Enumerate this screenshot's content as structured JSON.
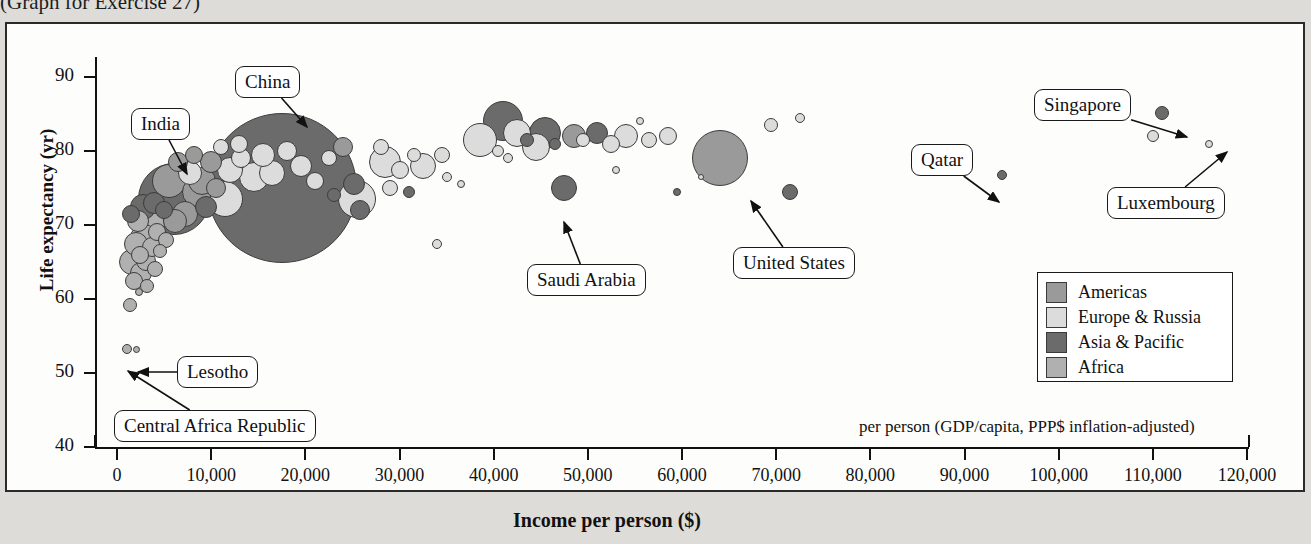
{
  "caption": "(Graph for Exercise 27)",
  "chart_data": {
    "type": "scatter",
    "title": "",
    "xlabel": "Income per person ($)",
    "ylabel": "Life expectancy (yr)",
    "note": "per person (GDP/capita, PPP$ inflation-adjusted)",
    "xlim": [
      0,
      120000
    ],
    "ylim": [
      40,
      90
    ],
    "xticks": [
      0,
      10000,
      20000,
      30000,
      40000,
      50000,
      60000,
      70000,
      80000,
      90000,
      100000,
      110000,
      120000
    ],
    "xticklabels": [
      "0",
      "10,000",
      "20,000",
      "30,000",
      "40,000",
      "50,000",
      "60,000",
      "70,000",
      "80,000",
      "90,000",
      "100,000",
      "110,000",
      "120,000"
    ],
    "yticks": [
      40,
      50,
      60,
      70,
      80,
      90
    ],
    "yticklabels": [
      "40",
      "50",
      "60",
      "70",
      "80",
      "90"
    ],
    "grid": false,
    "legend_position": "right-inside",
    "bubble_meaning": "bubble area proportional to population",
    "legend": [
      {
        "label": "Americas",
        "color": "#9a9a9a"
      },
      {
        "label": "Europe & Russia",
        "color": "#dcdcdc"
      },
      {
        "label": "Asia & Pacific",
        "color": "#6b6b6b"
      },
      {
        "label": "Africa",
        "color": "#b0b0b0"
      }
    ],
    "annotations": [
      {
        "label": "China",
        "box_x": 228,
        "box_y": 42,
        "tip_x": 300,
        "tip_y": 103
      },
      {
        "label": "India",
        "box_x": 124,
        "box_y": 84,
        "tip_x": 180,
        "tip_y": 150
      },
      {
        "label": "Lesotho",
        "box_x": 170,
        "box_y": 332,
        "tip_x": 131,
        "tip_y": 348
      },
      {
        "label": "Central Africa Republic",
        "box_x": 107,
        "box_y": 386,
        "tip_x": 121,
        "tip_y": 347
      },
      {
        "label": "Saudi Arabia",
        "box_x": 520,
        "box_y": 240,
        "tip_x": 557,
        "tip_y": 198
      },
      {
        "label": "United States",
        "box_x": 726,
        "box_y": 223,
        "tip_x": 744,
        "tip_y": 177
      },
      {
        "label": "Qatar",
        "box_x": 904,
        "box_y": 120,
        "tip_x": 992,
        "tip_y": 178
      },
      {
        "label": "Singapore",
        "box_x": 1027,
        "box_y": 65,
        "tip_x": 1180,
        "tip_y": 113
      },
      {
        "label": "Luxembourg",
        "box_x": 1100,
        "box_y": 163,
        "tip_x": 1220,
        "tip_y": 128
      }
    ],
    "points": [
      {
        "x": 1100,
        "y": 53.3,
        "r": 5,
        "g": "Africa"
      },
      {
        "x": 2100,
        "y": 53.2,
        "r": 3.5,
        "g": "Africa"
      },
      {
        "x": 1400,
        "y": 59.2,
        "r": 7,
        "g": "Africa"
      },
      {
        "x": 2300,
        "y": 61.0,
        "r": 4,
        "g": "Africa"
      },
      {
        "x": 1800,
        "y": 62.5,
        "r": 9,
        "g": "Africa"
      },
      {
        "x": 2600,
        "y": 63.5,
        "r": 11,
        "g": "Africa"
      },
      {
        "x": 3200,
        "y": 61.8,
        "r": 7,
        "g": "Africa"
      },
      {
        "x": 1600,
        "y": 65.0,
        "r": 13,
        "g": "Africa"
      },
      {
        "x": 2400,
        "y": 66.0,
        "r": 9,
        "g": "Africa"
      },
      {
        "x": 3100,
        "y": 65.2,
        "r": 10,
        "g": "Africa"
      },
      {
        "x": 4000,
        "y": 64.0,
        "r": 8,
        "g": "Africa"
      },
      {
        "x": 2000,
        "y": 67.5,
        "r": 12,
        "g": "Africa"
      },
      {
        "x": 2900,
        "y": 68.2,
        "r": 14,
        "g": "Africa"
      },
      {
        "x": 3700,
        "y": 67.0,
        "r": 10,
        "g": "Africa"
      },
      {
        "x": 4600,
        "y": 66.5,
        "r": 7,
        "g": "Africa"
      },
      {
        "x": 2200,
        "y": 70.5,
        "r": 11,
        "g": "Africa"
      },
      {
        "x": 3400,
        "y": 70.0,
        "r": 16,
        "g": "Africa"
      },
      {
        "x": 4300,
        "y": 69.0,
        "r": 9,
        "g": "Africa"
      },
      {
        "x": 5200,
        "y": 68.0,
        "r": 8,
        "g": "Africa"
      },
      {
        "x": 1500,
        "y": 71.5,
        "r": 9,
        "g": "Asia & Pacific"
      },
      {
        "x": 2800,
        "y": 72.5,
        "r": 13,
        "g": "Asia & Pacific"
      },
      {
        "x": 3900,
        "y": 73.0,
        "r": 11,
        "g": "Asia & Pacific"
      },
      {
        "x": 5000,
        "y": 72.0,
        "r": 9,
        "g": "Asia & Pacific"
      },
      {
        "x": 6200,
        "y": 70.5,
        "r": 12,
        "g": "Americas"
      },
      {
        "x": 6000,
        "y": 73.5,
        "r": 36,
        "g": "Asia & Pacific"
      },
      {
        "x": 8500,
        "y": 74.5,
        "r": 15,
        "g": "Americas"
      },
      {
        "x": 7200,
        "y": 71.5,
        "r": 13,
        "g": "Americas"
      },
      {
        "x": 9500,
        "y": 72.5,
        "r": 11,
        "g": "Asia & Pacific"
      },
      {
        "x": 5500,
        "y": 76.0,
        "r": 17,
        "g": "Americas"
      },
      {
        "x": 7800,
        "y": 77.0,
        "r": 12,
        "g": "Europe & Russia"
      },
      {
        "x": 9000,
        "y": 76.0,
        "r": 14,
        "g": "Americas"
      },
      {
        "x": 10500,
        "y": 75.0,
        "r": 10,
        "g": "Americas"
      },
      {
        "x": 11500,
        "y": 73.5,
        "r": 18,
        "g": "Europe & Russia"
      },
      {
        "x": 6500,
        "y": 78.5,
        "r": 10,
        "g": "Americas"
      },
      {
        "x": 8200,
        "y": 79.5,
        "r": 9,
        "g": "Americas"
      },
      {
        "x": 10000,
        "y": 78.5,
        "r": 11,
        "g": "Americas"
      },
      {
        "x": 12000,
        "y": 77.5,
        "r": 13,
        "g": "Europe & Russia"
      },
      {
        "x": 13200,
        "y": 79.0,
        "r": 10,
        "g": "Europe & Russia"
      },
      {
        "x": 14500,
        "y": 76.5,
        "r": 15,
        "g": "Europe & Russia"
      },
      {
        "x": 11000,
        "y": 80.5,
        "r": 8,
        "g": "Europe & Russia"
      },
      {
        "x": 13000,
        "y": 81.0,
        "r": 9,
        "g": "Europe & Russia"
      },
      {
        "x": 15500,
        "y": 79.5,
        "r": 12,
        "g": "Europe & Russia"
      },
      {
        "x": 16500,
        "y": 77.0,
        "r": 13,
        "g": "Europe & Russia"
      },
      {
        "x": 18000,
        "y": 80.0,
        "r": 10,
        "g": "Europe & Russia"
      },
      {
        "x": 19500,
        "y": 78.0,
        "r": 11,
        "g": "Europe & Russia"
      },
      {
        "x": 17500,
        "y": 75.0,
        "r": 75,
        "g": "Asia & Pacific"
      },
      {
        "x": 21000,
        "y": 76.0,
        "r": 9,
        "g": "Europe & Russia"
      },
      {
        "x": 22500,
        "y": 79.0,
        "r": 8,
        "g": "Europe & Russia"
      },
      {
        "x": 24000,
        "y": 80.5,
        "r": 10,
        "g": "Americas"
      },
      {
        "x": 23000,
        "y": 74.0,
        "r": 7,
        "g": "Asia & Pacific"
      },
      {
        "x": 25500,
        "y": 73.5,
        "r": 19,
        "g": "Europe & Russia"
      },
      {
        "x": 25200,
        "y": 75.5,
        "r": 11,
        "g": "Asia & Pacific"
      },
      {
        "x": 25800,
        "y": 72.0,
        "r": 10,
        "g": "Asia & Pacific"
      },
      {
        "x": 28500,
        "y": 78.5,
        "r": 16,
        "g": "Europe & Russia"
      },
      {
        "x": 28000,
        "y": 80.5,
        "r": 8,
        "g": "Europe & Russia"
      },
      {
        "x": 30000,
        "y": 77.5,
        "r": 9,
        "g": "Europe & Russia"
      },
      {
        "x": 29000,
        "y": 75.0,
        "r": 8,
        "g": "Europe & Russia"
      },
      {
        "x": 31500,
        "y": 79.5,
        "r": 7,
        "g": "Europe & Russia"
      },
      {
        "x": 32500,
        "y": 78.0,
        "r": 13,
        "g": "Europe & Russia"
      },
      {
        "x": 31000,
        "y": 74.5,
        "r": 6,
        "g": "Asia & Pacific"
      },
      {
        "x": 34000,
        "y": 67.5,
        "r": 5,
        "g": "Europe & Russia"
      },
      {
        "x": 35000,
        "y": 76.5,
        "r": 5,
        "g": "Europe & Russia"
      },
      {
        "x": 36500,
        "y": 75.5,
        "r": 4,
        "g": "Europe & Russia"
      },
      {
        "x": 34500,
        "y": 79.5,
        "r": 8,
        "g": "Europe & Russia"
      },
      {
        "x": 38500,
        "y": 81.5,
        "r": 17,
        "g": "Europe & Russia"
      },
      {
        "x": 41000,
        "y": 84.0,
        "r": 20,
        "g": "Asia & Pacific"
      },
      {
        "x": 42500,
        "y": 82.5,
        "r": 14,
        "g": "Europe & Russia"
      },
      {
        "x": 40500,
        "y": 80.0,
        "r": 6,
        "g": "Europe & Russia"
      },
      {
        "x": 41500,
        "y": 79.0,
        "r": 5,
        "g": "Europe & Russia"
      },
      {
        "x": 43500,
        "y": 81.5,
        "r": 7,
        "g": "Asia & Pacific"
      },
      {
        "x": 45500,
        "y": 82.5,
        "r": 16,
        "g": "Asia & Pacific"
      },
      {
        "x": 44500,
        "y": 80.5,
        "r": 14,
        "g": "Europe & Russia"
      },
      {
        "x": 46500,
        "y": 81.0,
        "r": 6,
        "g": "Asia & Pacific"
      },
      {
        "x": 47500,
        "y": 75.0,
        "r": 13,
        "g": "Asia & Pacific"
      },
      {
        "x": 48500,
        "y": 82.0,
        "r": 12,
        "g": "Americas"
      },
      {
        "x": 49500,
        "y": 81.5,
        "r": 7,
        "g": "Europe & Russia"
      },
      {
        "x": 51000,
        "y": 82.5,
        "r": 11,
        "g": "Asia & Pacific"
      },
      {
        "x": 52500,
        "y": 81.0,
        "r": 9,
        "g": "Europe & Russia"
      },
      {
        "x": 54000,
        "y": 82.0,
        "r": 12,
        "g": "Europe & Russia"
      },
      {
        "x": 53000,
        "y": 77.5,
        "r": 4,
        "g": "Europe & Russia"
      },
      {
        "x": 55500,
        "y": 84.0,
        "r": 4,
        "g": "Europe & Russia"
      },
      {
        "x": 56500,
        "y": 81.5,
        "r": 8,
        "g": "Europe & Russia"
      },
      {
        "x": 58500,
        "y": 82.0,
        "r": 9,
        "g": "Europe & Russia"
      },
      {
        "x": 59500,
        "y": 74.5,
        "r": 4,
        "g": "Asia & Pacific"
      },
      {
        "x": 64000,
        "y": 79.0,
        "r": 28,
        "g": "Americas"
      },
      {
        "x": 62000,
        "y": 76.5,
        "r": 3,
        "g": "Europe & Russia"
      },
      {
        "x": 69500,
        "y": 83.5,
        "r": 7,
        "g": "Europe & Russia"
      },
      {
        "x": 71500,
        "y": 74.5,
        "r": 8,
        "g": "Asia & Pacific"
      },
      {
        "x": 72500,
        "y": 84.5,
        "r": 5,
        "g": "Europe & Russia"
      },
      {
        "x": 94000,
        "y": 76.8,
        "r": 5,
        "g": "Asia & Pacific"
      },
      {
        "x": 111000,
        "y": 85.2,
        "r": 7,
        "g": "Asia & Pacific"
      },
      {
        "x": 110000,
        "y": 82.0,
        "r": 6,
        "g": "Europe & Russia"
      },
      {
        "x": 116000,
        "y": 81.0,
        "r": 4,
        "g": "Europe & Russia"
      }
    ]
  }
}
